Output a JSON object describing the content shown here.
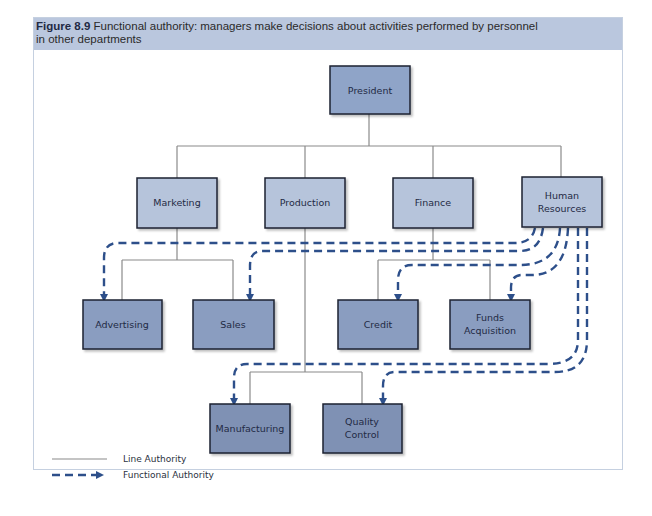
{
  "caption": {
    "figure_number": "Figure 8.9",
    "text_line1": " Functional authority: managers make decisions about activities performed by personnel",
    "text_line2": "in other departments"
  },
  "colors": {
    "level1_fill": "#8fa4c8",
    "level2_fill": "#b6c4db",
    "level3_fill": "#8a9dc0",
    "level4_fill": "#7f91b4",
    "line_authority": "#8a8a8a",
    "functional_authority": "#2d4f8a",
    "box_border": "#1e2230"
  },
  "nodes": {
    "president": {
      "label": "President"
    },
    "marketing": {
      "label": "Marketing"
    },
    "production": {
      "label": "Production"
    },
    "finance": {
      "label": "Finance"
    },
    "hr": {
      "label_line1": "Human",
      "label_line2": "Resources"
    },
    "advertising": {
      "label": "Advertising"
    },
    "sales": {
      "label": "Sales"
    },
    "credit": {
      "label": "Credit"
    },
    "funds": {
      "label_line1": "Funds",
      "label_line2": "Acquisition"
    },
    "manufacturing": {
      "label": "Manufacturing"
    },
    "quality": {
      "label_line1": "Quality",
      "label_line2": "Control"
    }
  },
  "edges": {
    "line_authority": [
      [
        "President",
        "Marketing"
      ],
      [
        "President",
        "Production"
      ],
      [
        "President",
        "Finance"
      ],
      [
        "President",
        "Human Resources"
      ],
      [
        "Marketing",
        "Advertising"
      ],
      [
        "Marketing",
        "Sales"
      ],
      [
        "Finance",
        "Credit"
      ],
      [
        "Finance",
        "Funds Acquisition"
      ],
      [
        "Production",
        "Manufacturing"
      ],
      [
        "Production",
        "Quality Control"
      ]
    ],
    "functional_authority": [
      [
        "Human Resources",
        "Advertising"
      ],
      [
        "Human Resources",
        "Sales"
      ],
      [
        "Human Resources",
        "Credit"
      ],
      [
        "Human Resources",
        "Funds Acquisition"
      ],
      [
        "Human Resources",
        "Manufacturing"
      ],
      [
        "Human Resources",
        "Quality Control"
      ]
    ]
  },
  "legend": {
    "line_authority": "Line Authority",
    "functional_authority": "Functional Authority"
  }
}
